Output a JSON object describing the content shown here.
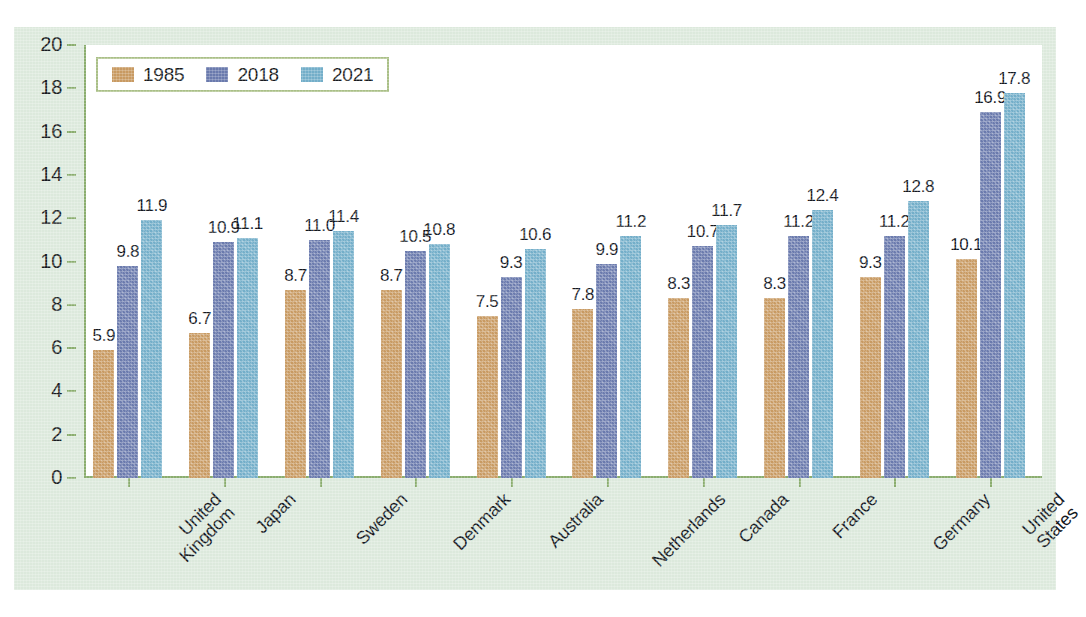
{
  "chart_data": {
    "type": "bar",
    "title": "",
    "subtitle": "",
    "xlabel": "",
    "ylabel": "",
    "ylim": [
      0,
      20
    ],
    "y_ticks": [
      0,
      2,
      4,
      6,
      8,
      10,
      12,
      14,
      16,
      18,
      20
    ],
    "grid": false,
    "legend_position": "top-left",
    "categories": [
      "United Kingdom",
      "Japan",
      "Sweden",
      "Denmark",
      "Australia",
      "Netherlands",
      "Canada",
      "France",
      "Germany",
      "United States"
    ],
    "category_lines": [
      [
        "United",
        "Kingdom"
      ],
      [
        "Japan"
      ],
      [
        "Sweden"
      ],
      [
        "Denmark"
      ],
      [
        "Australia"
      ],
      [
        "Netherlands"
      ],
      [
        "Canada"
      ],
      [
        "France"
      ],
      [
        "Germany"
      ],
      [
        "United",
        "States"
      ]
    ],
    "series": [
      {
        "name": "1985",
        "color": "#c89a62",
        "values": [
          5.9,
          6.7,
          8.7,
          8.7,
          7.5,
          7.8,
          8.3,
          8.3,
          9.3,
          10.1
        ]
      },
      {
        "name": "2018",
        "color": "#6a7aad",
        "values": [
          9.8,
          10.9,
          11.0,
          10.5,
          9.3,
          9.9,
          10.7,
          11.2,
          11.2,
          16.9
        ]
      },
      {
        "name": "2021",
        "color": "#73aec9",
        "values": [
          11.9,
          11.1,
          11.4,
          10.8,
          10.6,
          11.2,
          11.7,
          12.4,
          12.8,
          17.8
        ]
      }
    ],
    "value_label_format": "one-decimal"
  },
  "style": {
    "panel_background": "#dce9dc",
    "plot_background": "#ffffff",
    "axis_color": "#8aad6e",
    "legend_border": "#a9bf86",
    "text_color": "#14181f"
  }
}
